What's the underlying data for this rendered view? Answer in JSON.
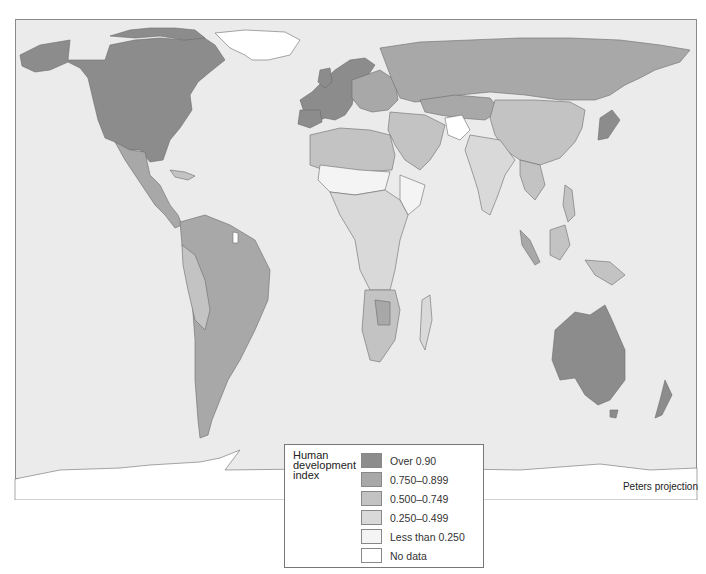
{
  "map": {
    "title_cut_off": "",
    "projection": "Peters projection",
    "ocean_color": "#ebebeb",
    "border_color": "#6b6b6b"
  },
  "legend": {
    "title": "Human development index",
    "items": [
      {
        "label": "Over 0.90",
        "color": "#8c8c8c"
      },
      {
        "label": "0.750–0.899",
        "color": "#a8a8a8"
      },
      {
        "label": "0.500–0.749",
        "color": "#c3c3c3"
      },
      {
        "label": "0.250–0.499",
        "color": "#d9d9d9"
      },
      {
        "label": "Less than 0.250",
        "color": "#f4f4f4"
      },
      {
        "label": "No data",
        "color": "#ffffff"
      }
    ]
  },
  "regions": [
    {
      "name": "North America (USA/Canada)",
      "class": "Over 0.90"
    },
    {
      "name": "Western Europe",
      "class": "Over 0.90"
    },
    {
      "name": "Australia",
      "class": "Over 0.90"
    },
    {
      "name": "New Zealand",
      "class": "Over 0.90"
    },
    {
      "name": "Japan",
      "class": "Over 0.90"
    },
    {
      "name": "Russia / Eastern Europe",
      "class": "0.750–0.899"
    },
    {
      "name": "South America (most)",
      "class": "0.750–0.899"
    },
    {
      "name": "Mexico / Central America",
      "class": "0.750–0.899"
    },
    {
      "name": "Middle East / North Africa (part)",
      "class": "0.500–0.749"
    },
    {
      "name": "China",
      "class": "0.500–0.749"
    },
    {
      "name": "Southeast Asia",
      "class": "0.500–0.749"
    },
    {
      "name": "India / South Asia",
      "class": "0.250–0.499"
    },
    {
      "name": "Sub-Saharan Africa (most)",
      "class": "0.250–0.499"
    },
    {
      "name": "Sahel / Horn of Africa / Afghanistan",
      "class": "Less than 0.250"
    },
    {
      "name": "Greenland",
      "class": "No data"
    },
    {
      "name": "Antarctica",
      "class": "No data"
    }
  ]
}
